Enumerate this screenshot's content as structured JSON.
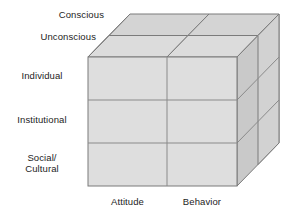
{
  "diagram": {
    "type": "3d-cube-matrix",
    "depth_labels": [
      {
        "id": "conscious",
        "label": "Conscious"
      },
      {
        "id": "unconscious",
        "label": "Unconscious"
      }
    ],
    "row_labels": [
      {
        "id": "individual",
        "label": "Individual"
      },
      {
        "id": "institutional",
        "label": "Institutional"
      },
      {
        "id": "social-cultural",
        "label": "Social/\nCultural"
      }
    ],
    "column_labels": [
      {
        "id": "attitude",
        "label": "Attitude"
      },
      {
        "id": "behavior",
        "label": "Behavior"
      }
    ],
    "dimensions": {
      "rows": 3,
      "columns": 2,
      "layers": 2
    },
    "colors": {
      "front_face": "#dedede",
      "top_face": "#d4d4d4",
      "side_face": "#c9c9c9",
      "side_face_back": "#d2d2d2",
      "stroke": "#7b7b7b",
      "stroke_inner": "#8a8a8a",
      "background": "#ffffff",
      "text": "#1d1d1d"
    },
    "geometry": {
      "front_left_x": 88,
      "front_right_x": 237,
      "front_top_y": 57,
      "front_bottom_y": 186,
      "column_divider_x": 167,
      "row_divider_1_y": 100,
      "row_divider_2_y": 143,
      "depth_dx": 42,
      "depth_dy": -43,
      "slab_split_dx": 21
    }
  }
}
